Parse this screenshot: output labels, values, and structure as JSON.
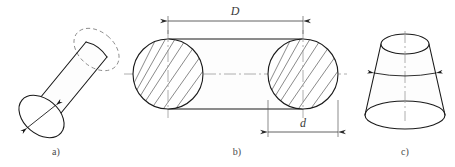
{
  "sheet": {
    "title": "O-ring geometry figure set",
    "background_color": "#ffffff",
    "line_color": "#1a1a1a",
    "hidden_line_color": "#8a8a8a",
    "centerline_color": "#9a9a9a",
    "hatch_color": "#4a4a4a",
    "width": 455,
    "height": 167
  },
  "figures": [
    {
      "id": "a",
      "caption": "a)",
      "name": "oblique-cylinder",
      "description": "Pictorial view of an inclined circular cylinder with hidden back edge and a diameter arrow on the near face"
    },
    {
      "id": "b",
      "caption": "b)",
      "name": "oring-cross-section",
      "description": "Sectional view of an O-ring showing two hatched circular cross sections joined by straight tangent outlines"
    },
    {
      "id": "c",
      "caption": "c)",
      "name": "truncated-cone",
      "description": "Pictorial view of a frustum of a cone with vertical axis centerline and a horizontal diameter arrow"
    }
  ],
  "dimensions": [
    {
      "symbol": "D",
      "name": "outer-diameter",
      "placement": "above",
      "figure": "b"
    },
    {
      "symbol": "d",
      "name": "cord-diameter",
      "placement": "below",
      "figure": "b"
    }
  ]
}
